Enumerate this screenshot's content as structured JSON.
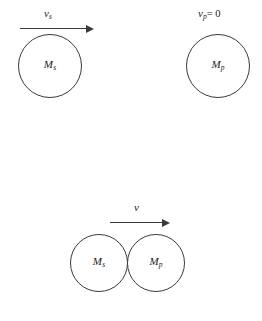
{
  "figure": {
    "stroke_color": "#3a3a3a",
    "background_color": "#ffffff"
  },
  "stages": {
    "before": {
      "source": {
        "mass_symbol": "M",
        "mass_subscript": "s",
        "velocity_symbol": "v",
        "velocity_subscript": "s",
        "velocity_prime": "",
        "velocity_equals": "",
        "arrow": "arrow-right"
      },
      "planet": {
        "mass_symbol": "M",
        "mass_subscript": "p",
        "velocity_symbol": "v",
        "velocity_subscript": "p",
        "velocity_prime": "",
        "velocity_equals": "= 0",
        "arrow": "none"
      }
    },
    "contact": {
      "source": {
        "mass_symbol": "M",
        "mass_subscript": "s"
      },
      "planet": {
        "mass_symbol": "M",
        "mass_subscript": "p"
      },
      "common_velocity": {
        "velocity_symbol": "v",
        "velocity_subscript": "",
        "velocity_prime": "",
        "arrow": "arrow-right"
      }
    },
    "after": {
      "source": {
        "mass_symbol": "M",
        "mass_subscript": "s",
        "velocity_symbol": "v",
        "velocity_subscript": "s",
        "velocity_prime": "′",
        "arrow": "arrow-right"
      },
      "planet": {
        "mass_symbol": "M",
        "mass_subscript": "p",
        "velocity_symbol": "v",
        "velocity_subscript": "p",
        "velocity_prime": "′",
        "arrow": "arrow-right"
      }
    }
  }
}
